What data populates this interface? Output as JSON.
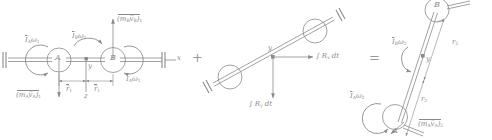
{
  "figure": {
    "type": "engineering-mechanics-diagram",
    "ink_color": "#8a8a8a",
    "background": "#ffffff",
    "operators": {
      "plus": "+",
      "equals": "="
    }
  },
  "panel1": {
    "name": "initial-momenta",
    "bodies": {
      "disk_a": "A",
      "disk_b": "B"
    },
    "axes": {
      "x": "x",
      "y": "y",
      "z": "z"
    },
    "labels": {
      "ia_omega1_left": "I̅",
      "ia_omega1_left_sub": "A",
      "ia_omega1_left_tail": "ω",
      "ia_omega1_left_tail_sub": "1",
      "ib_omega1_mid": "I̅",
      "ib_omega1_mid_sub": "B",
      "ib_omega1_mid_tail": "ω",
      "ib_omega1_mid_tail_sub": "1",
      "ia_omega1_right": "I̅",
      "ia_omega1_right_sub": "A",
      "ia_omega1_right_tail": "ω",
      "ia_omega1_right_tail_sub": "1",
      "mb_vb_1": "(m",
      "mb_vb_1_sub": "B",
      "mb_vb_1_v": "v̅",
      "mb_vb_1_vsub": "B",
      "mb_vb_1_close": ")",
      "mb_vb_1_outsub": "1",
      "ma_va_1": "(m",
      "ma_va_1_sub": "A",
      "ma_va_1_v": "v̅",
      "ma_va_1_vsub": "A",
      "ma_va_1_close": ")",
      "ma_va_1_outsub": "1",
      "r1_left": "r̅",
      "r1_left_sub": "1",
      "r1_right": "r̅",
      "r1_right_sub": "1"
    }
  },
  "panel2": {
    "name": "impulses",
    "axes": {
      "y": "y"
    },
    "labels": {
      "impulse_x": "∫ R",
      "impulse_x_sub": "x",
      "impulse_x_dt": " dt",
      "impulse_y": "∫ R",
      "impulse_y_sub": "y",
      "impulse_y_dt": " dt"
    }
  },
  "panel3": {
    "name": "final-momenta",
    "bodies": {
      "disk_a": "A",
      "disk_b": "B"
    },
    "axes": {
      "y": "y"
    },
    "labels": {
      "ib_omega2": "I̅",
      "ib_omega2_sub": "B",
      "ib_omega2_tail": "ω",
      "ib_omega2_tail_sub": "2",
      "ia_omega2": "I̅",
      "ia_omega2_sub": "A",
      "ia_omega2_tail": "ω",
      "ia_omega2_tail_sub": "2",
      "r2_upper": "r",
      "r2_upper_sub": "2",
      "r2_lower": "r",
      "r2_lower_sub": "2",
      "ma_va_2": "(m",
      "ma_va_2_sub": "A",
      "ma_va_2_v": "v̅",
      "ma_va_2_vsub": "A",
      "ma_va_2_close": ")",
      "ma_va_2_outsub": "2"
    }
  }
}
